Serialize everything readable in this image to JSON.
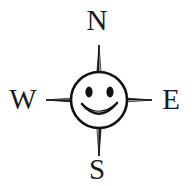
{
  "figure": {
    "name": "compass-rose-smiley-face",
    "caption": "",
    "background_color": "#ffffff",
    "ink_color": "#1a1a1a",
    "center": {
      "x": 99,
      "y": 100
    }
  },
  "cardinals": {
    "north": "N",
    "south": "S",
    "east": "E",
    "west": "W"
  },
  "star": {
    "points": 4,
    "tips": {
      "north_y": 45,
      "south_y": 156,
      "west_x": 46,
      "east_x": 152
    },
    "shading": {
      "light_fill": "#ffffff",
      "dark_fill": "#1f1f1f",
      "outline": "#111111"
    }
  },
  "face": {
    "radius": 28,
    "outline_color": "#111111",
    "fill_color": "#ffffff",
    "eyes": [
      {
        "cx": 89,
        "cy": 92,
        "rx": 3.6,
        "ry": 5.4
      },
      {
        "cx": 110,
        "cy": 92,
        "rx": 3.6,
        "ry": 5.4
      }
    ],
    "smile": {
      "description": "wide upward arc",
      "color": "#111111"
    }
  }
}
